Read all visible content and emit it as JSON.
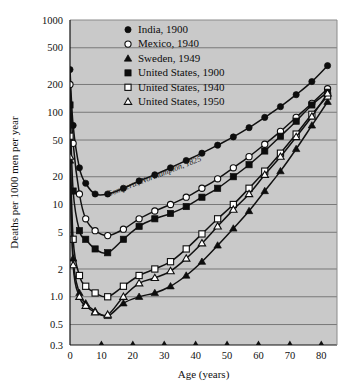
{
  "chart_data": {
    "type": "line",
    "title": "",
    "xlabel": "Age (years)",
    "ylabel": "Deaths per 1000 men per year",
    "xlim": [
      0,
      85
    ],
    "ylim": [
      0.3,
      1000
    ],
    "yscale": "log",
    "xticks": [
      0,
      10,
      20,
      30,
      40,
      50,
      60,
      70,
      80
    ],
    "xticklabels": [
      "0",
      "10",
      "20",
      "30",
      "40",
      "50",
      "60",
      "70",
      "80"
    ],
    "yticks": [
      0.3,
      0.5,
      1.0,
      2,
      5,
      10,
      20,
      50,
      100,
      200,
      500,
      1000
    ],
    "yticklabels": [
      "0.3",
      "0.5",
      "1.0",
      "2",
      "5",
      "10",
      "20",
      "50",
      "100",
      "200",
      "500",
      "1000"
    ],
    "grid": true,
    "grid_axis": "y",
    "legend_position": "top-center",
    "plot_background": "#c9c9c9",
    "annotations": [
      {
        "text": "Gompertz, Northampton, 1825",
        "x": 27,
        "y": 19,
        "rotation": -21,
        "style": "italic"
      }
    ],
    "series": [
      {
        "name": "India, 1900",
        "marker": "filled-circle",
        "color": "#111111",
        "x": [
          0,
          1,
          3,
          5,
          8,
          12,
          17,
          22,
          27,
          32,
          37,
          42,
          47,
          52,
          57,
          62,
          67,
          72,
          77,
          82
        ],
        "values": [
          290,
          72,
          25,
          17,
          13,
          13,
          15,
          18,
          21,
          25,
          30,
          36,
          44,
          54,
          68,
          88,
          115,
          155,
          215,
          320
        ]
      },
      {
        "name": "Mexico, 1940",
        "marker": "open-circle",
        "color": "#111111",
        "x": [
          0,
          1,
          3,
          5,
          8,
          12,
          17,
          22,
          27,
          32,
          37,
          42,
          47,
          52,
          57,
          62,
          67,
          72,
          77,
          82
        ],
        "values": [
          200,
          46,
          13,
          7.0,
          5.2,
          4.6,
          5.4,
          7.0,
          8.5,
          10,
          12,
          15,
          19,
          25,
          33,
          45,
          62,
          88,
          125,
          180
        ]
      },
      {
        "name": "Sweden, 1949",
        "marker": "filled-triangle",
        "color": "#111111",
        "x": [
          0,
          1,
          3,
          5,
          8,
          12,
          17,
          22,
          27,
          32,
          37,
          42,
          47,
          52,
          57,
          62,
          67,
          72,
          77,
          82
        ],
        "values": [
          30,
          2.6,
          1.1,
          0.85,
          0.7,
          0.62,
          0.85,
          1.0,
          1.1,
          1.3,
          1.7,
          2.4,
          3.6,
          5.5,
          8.5,
          14,
          23,
          40,
          72,
          130
        ]
      },
      {
        "name": "United States, 1900",
        "marker": "filled-square",
        "color": "#111111",
        "x": [
          0,
          1,
          3,
          5,
          8,
          12,
          17,
          22,
          27,
          32,
          37,
          42,
          47,
          52,
          57,
          62,
          67,
          72,
          77,
          82
        ],
        "values": [
          120,
          14,
          5.2,
          4.2,
          3.3,
          3.0,
          4.2,
          5.8,
          7.0,
          8.0,
          9.5,
          12,
          15,
          20,
          27,
          38,
          55,
          80,
          120,
          165
        ]
      },
      {
        "name": "United States, 1940",
        "marker": "open-square",
        "color": "#111111",
        "x": [
          0,
          1,
          3,
          5,
          8,
          12,
          17,
          22,
          27,
          32,
          37,
          42,
          47,
          52,
          57,
          62,
          67,
          72,
          77,
          82
        ],
        "values": [
          55,
          4.2,
          1.7,
          1.3,
          1.1,
          1.0,
          1.3,
          1.7,
          2.0,
          2.4,
          3.3,
          4.8,
          7.0,
          10,
          15,
          23,
          36,
          58,
          95,
          150
        ]
      },
      {
        "name": "United States, 1950",
        "marker": "open-triangle",
        "color": "#111111",
        "x": [
          0,
          1,
          3,
          5,
          8,
          12,
          17,
          22,
          27,
          32,
          37,
          42,
          47,
          52,
          57,
          62,
          67,
          72,
          77,
          82
        ],
        "values": [
          33,
          2.2,
          1.0,
          0.8,
          0.68,
          0.64,
          1.0,
          1.4,
          1.6,
          1.9,
          2.6,
          3.8,
          5.8,
          8.8,
          13,
          21,
          33,
          54,
          90,
          160
        ]
      }
    ]
  },
  "legend": {
    "items": [
      {
        "label": "India, 1900",
        "marker": "filled-circle"
      },
      {
        "label": "Mexico, 1940",
        "marker": "open-circle"
      },
      {
        "label": "Sweden, 1949",
        "marker": "filled-triangle"
      },
      {
        "label": "United States, 1900",
        "marker": "filled-square"
      },
      {
        "label": "United States, 1940",
        "marker": "open-square"
      },
      {
        "label": "United States, 1950",
        "marker": "open-triangle"
      }
    ]
  }
}
